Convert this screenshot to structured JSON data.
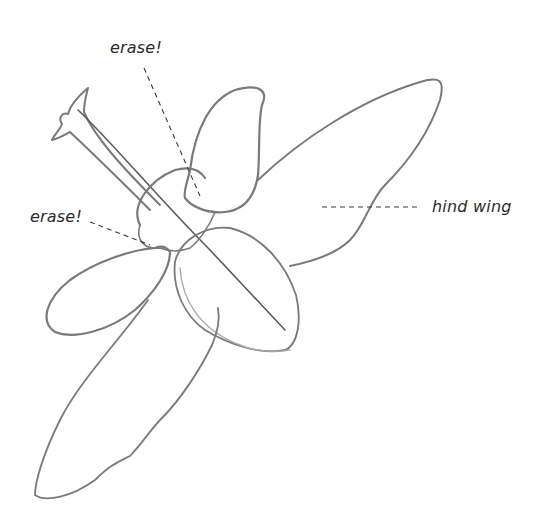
{
  "figure": {
    "type": "pencil-sketch",
    "stroke_color": "#7a7a7a",
    "background": "#ffffff"
  },
  "labels": [
    {
      "id": "erase-top",
      "text": "erase!"
    },
    {
      "id": "erase-left",
      "text": "erase!"
    },
    {
      "id": "hind-wing",
      "text": "hind wing"
    }
  ]
}
